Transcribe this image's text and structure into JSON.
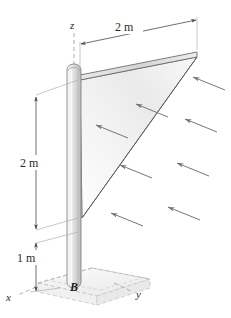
{
  "figure": {
    "kind": "engineering-free-body-diagram",
    "background_color": "#ffffff",
    "line_color": "#3a3a3a",
    "dashed_color": "#9a9a9a",
    "pole_fill_light": "#f4f4f4",
    "pole_fill_mid": "#d8d8d8",
    "pole_edge_color": "#8a8a8a",
    "sail_fill_light": "#fdfdfd",
    "sail_fill_mid": "#e6e6e6",
    "arrow_color": "#6f6f6f",
    "base_fill": "#f2f2f2"
  },
  "dimensions": [
    {
      "id": "top-span",
      "label": "2 m",
      "orientation": "horizontal",
      "measures": "sail top edge length"
    },
    {
      "id": "pole-upper",
      "label": "2 m",
      "orientation": "vertical",
      "measures": "sail vertical height along pole"
    },
    {
      "id": "pole-lower",
      "label": "1 m",
      "orientation": "vertical",
      "measures": "pole height below sail to base"
    }
  ],
  "axes": [
    {
      "id": "z",
      "label": "z",
      "direction": "up"
    },
    {
      "id": "y",
      "label": "y",
      "direction": "right-down"
    },
    {
      "id": "x",
      "label": "x",
      "direction": "left-down"
    }
  ],
  "points": [
    {
      "id": "B",
      "label": "B",
      "description": "fixed support at pole base"
    }
  ],
  "wind_arrows": {
    "count": 8,
    "direction": "toward upper-left, normal to sail face",
    "label": ""
  }
}
